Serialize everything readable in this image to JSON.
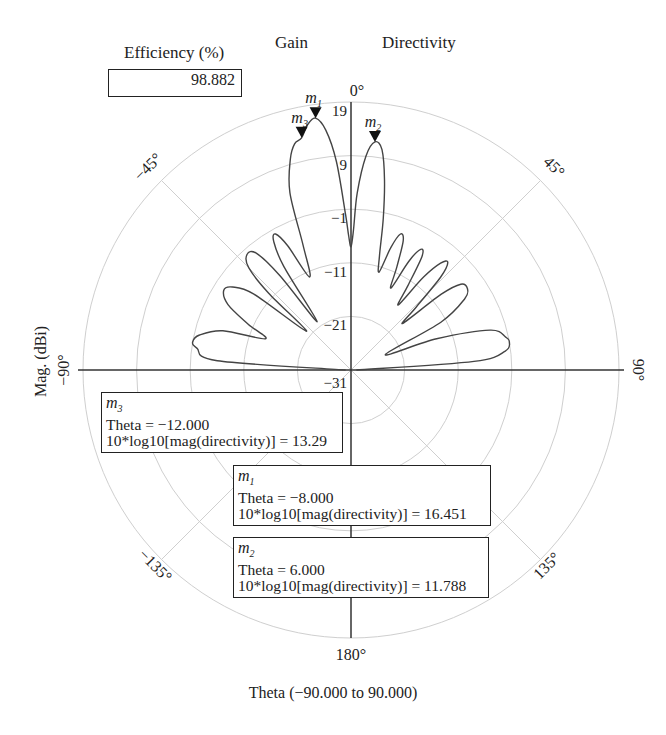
{
  "header": {
    "efficiency_label": "Efficiency (%)",
    "efficiency_value": "98.882",
    "gain_label": "Gain",
    "directivity_label": "Directivity"
  },
  "axes": {
    "ylabel": "Mag. (dBi)",
    "xlabel": "Theta (−90.000 to 90.000)",
    "angle_labels": [
      {
        "angle": 0,
        "text": "0°"
      },
      {
        "angle": 45,
        "text": "45°"
      },
      {
        "angle": 90,
        "text": "90°"
      },
      {
        "angle": 135,
        "text": "135°"
      },
      {
        "angle": 180,
        "text": "180°"
      },
      {
        "angle": -135,
        "text": "−135°"
      },
      {
        "angle": -90,
        "text": "−90°"
      },
      {
        "angle": -45,
        "text": "−45°"
      }
    ],
    "radial_labels": [
      "19",
      "9",
      "−1",
      "−11",
      "−21",
      "−31"
    ]
  },
  "markers": [
    {
      "id": "m1",
      "name": "m",
      "sub": "1",
      "theta_line": "Theta = −8.000",
      "value_line": "10*log10[mag(directivity)] = 16.451"
    },
    {
      "id": "m2",
      "name": "m",
      "sub": "2",
      "theta_line": "Theta = 6.000",
      "value_line": "10*log10[mag(directivity)] = 11.788"
    },
    {
      "id": "m3",
      "name": "m",
      "sub": "3",
      "theta_line": "Theta = −12.000",
      "value_line": "10*log10[mag(directivity)] = 13.29"
    }
  ],
  "chart_data": {
    "type": "polar-line",
    "title": "",
    "xlabel": "Theta (−90.000 to 90.000)",
    "ylabel": "Mag. (dBi)",
    "radial_range": [
      -31,
      19
    ],
    "radial_ticks": [
      19,
      9,
      -1,
      -11,
      -21,
      -31
    ],
    "angular_ticks": [
      0,
      45,
      90,
      135,
      180,
      -135,
      -90,
      -45
    ],
    "legend": [
      "Gain",
      "Directivity"
    ],
    "efficiency_percent": 98.882,
    "series": [
      {
        "name": "10*log10[mag(directivity)]",
        "theta": [
          -90,
          -86,
          -82,
          -80,
          -77,
          -73,
          -70,
          -66,
          -62,
          -58,
          -55,
          -52,
          -49,
          -47,
          -45,
          -42,
          -39,
          -37,
          -35,
          -33,
          -31,
          -29,
          -27,
          -24,
          -21,
          -19,
          -16,
          -14,
          -12,
          -10,
          -8,
          -6,
          -4,
          -2,
          -1,
          0,
          1,
          2,
          4,
          6,
          8,
          10,
          12,
          14,
          16,
          18,
          20,
          22,
          24,
          26,
          28,
          30,
          32,
          34,
          36,
          38,
          40,
          42,
          44,
          46,
          48,
          50,
          52,
          55,
          58,
          62,
          66,
          70,
          74,
          78,
          80,
          83,
          86,
          90
        ],
        "values": [
          -30,
          -6,
          -2,
          -1,
          -2,
          -6,
          -14,
          -10,
          -5,
          -3,
          -4,
          -8,
          -20,
          -10,
          -4,
          -2,
          -3,
          -9,
          -20,
          -8,
          -3,
          -2,
          -5,
          -12,
          -6,
          4,
          10,
          12.5,
          13.29,
          15.5,
          16.451,
          14,
          8,
          -2,
          -6,
          -8,
          -5,
          2,
          9,
          11.788,
          10.5,
          5,
          -2,
          -9,
          -12,
          -7,
          -4,
          -5,
          -10,
          -14,
          -8,
          -5,
          -6,
          -12,
          -16,
          -9,
          -5,
          -4,
          -7,
          -14,
          -18,
          -9,
          -5,
          -4.5,
          -6,
          -12,
          -24,
          -14,
          -4,
          -1.5,
          -1,
          -2,
          -8,
          -30
        ]
      }
    ],
    "markers": [
      {
        "name": "m1",
        "theta": -8.0,
        "value": 16.451
      },
      {
        "name": "m2",
        "theta": 6.0,
        "value": 11.788
      },
      {
        "name": "m3",
        "theta": -12.0,
        "value": 13.29
      }
    ]
  }
}
